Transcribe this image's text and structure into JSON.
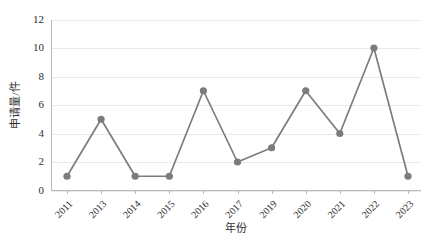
{
  "chart_data": {
    "type": "line",
    "title": "",
    "subtitle": "",
    "xlabel": "年份",
    "ylabel": "申请量/件",
    "categories": [
      "2011",
      "2013",
      "2014",
      "2015",
      "2016",
      "2017",
      "2019",
      "2020",
      "2021",
      "2022",
      "2023"
    ],
    "values": [
      1,
      5,
      1,
      1,
      7,
      2,
      3,
      7,
      4,
      10,
      1
    ],
    "series": [
      {
        "name": "申请量",
        "values": [
          1,
          5,
          1,
          1,
          7,
          2,
          3,
          7,
          4,
          10,
          1
        ]
      }
    ],
    "ylim": [
      0,
      12
    ],
    "ytick_labels": [
      "0",
      "2",
      "4",
      "6",
      "8",
      "10",
      "12"
    ],
    "ytick_values": [
      0,
      2,
      4,
      6,
      8,
      10,
      12
    ],
    "grid": true,
    "grid_axis": "y",
    "legend": false,
    "legend_position": "none",
    "marker": "circle",
    "colors": {
      "series": "#7c7c7c",
      "grid": "#e9e9e9",
      "axis": "#b9b9b9",
      "text": "#2e2e2e",
      "background": "#ffffff"
    }
  },
  "axes": {
    "y_title": "申请量/件",
    "x_title": "年份"
  },
  "caption": {
    "text": ""
  }
}
